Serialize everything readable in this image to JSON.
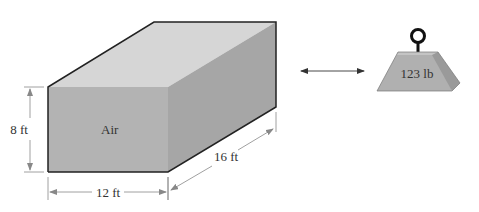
{
  "box": {
    "label": "Air",
    "height_label": "8 ft",
    "width_label": "12 ft",
    "depth_label": "16 ft",
    "colors": {
      "front": "#b3b3b3",
      "top": "#d6d6d6",
      "side": "#a6a6a6",
      "edge": "#222222"
    }
  },
  "weight": {
    "label": "123 lb",
    "colors": {
      "body": "#b0b0b0",
      "bevel": "#9a9a9a",
      "top": "#c4c4c4",
      "ring": "#111111"
    }
  },
  "connector": {
    "type": "double-arrow"
  }
}
